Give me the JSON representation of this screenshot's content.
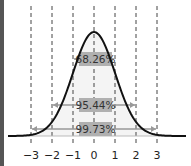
{
  "chart_data": {
    "type": "line",
    "title": "",
    "xlabel": "",
    "ylabel": "",
    "x_ticks": [
      "−3",
      "−2",
      "−1",
      "0",
      "1",
      "2",
      "3"
    ],
    "x_values": [
      -3,
      -2,
      -1,
      0,
      1,
      2,
      3
    ],
    "xlim": [
      -3.9,
      4.2
    ],
    "grid": "vertical dashed lines at each integer sigma",
    "series": [
      {
        "name": "normal density",
        "function": "exp(-x^2/2)/sqrt(2*pi)"
      }
    ],
    "intervals": [
      {
        "label": "68.26%",
        "from": -1,
        "to": 1
      },
      {
        "label": "95.44%",
        "from": -2,
        "to": 2
      },
      {
        "label": "99.73%",
        "from": -3,
        "to": 3
      }
    ],
    "legend": null
  },
  "colors": {
    "curve": "#111111",
    "dashed_lines": "#444444",
    "label_box": "#b0b0b0",
    "arrow": "#999999",
    "fill": "#eeeeee",
    "border": "#555555"
  }
}
